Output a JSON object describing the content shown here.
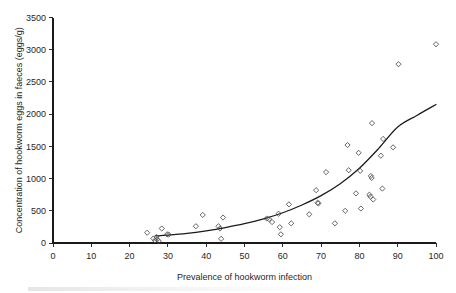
{
  "figure": {
    "background_color": "#ffffff",
    "axis_color": "#1a1a1a",
    "marker_color": "#4a4a4a",
    "curve_color": "#1a1a1a"
  },
  "chart_data": {
    "type": "scatter",
    "title": "",
    "subtitle": "",
    "xlabel": "Prevalence of hookworm infection",
    "ylabel": "Concentration of hookworm eggs in faeces (eggs/g)",
    "xlim": [
      0,
      100
    ],
    "ylim": [
      0,
      3500
    ],
    "xticks": [
      0,
      10,
      20,
      30,
      40,
      50,
      60,
      70,
      80,
      90,
      100
    ],
    "yticks": [
      0,
      500,
      1000,
      1500,
      2000,
      2500,
      3000,
      3500
    ],
    "xtick_labels": [
      "0",
      "10",
      "20",
      "30",
      "40",
      "50",
      "60",
      "70",
      "80",
      "90",
      "100"
    ],
    "ytick_labels": [
      "0",
      "500",
      "1000",
      "1500",
      "2000",
      "2500",
      "3000",
      "3500"
    ],
    "grid": false,
    "legend": null,
    "legend_position": "none",
    "marker_shape": "open-diamond",
    "series": [
      {
        "name": "Observed communities",
        "type": "scatter",
        "points": [
          [
            24.6,
            160
          ],
          [
            26.2,
            70
          ],
          [
            26.6,
            40
          ],
          [
            27.0,
            95
          ],
          [
            27.2,
            55
          ],
          [
            27.6,
            30
          ],
          [
            28.4,
            225
          ],
          [
            29.8,
            135
          ],
          [
            30.2,
            130
          ],
          [
            37.3,
            260
          ],
          [
            39.1,
            435
          ],
          [
            43.2,
            260
          ],
          [
            43.6,
            225
          ],
          [
            43.9,
            65
          ],
          [
            44.4,
            395
          ],
          [
            55.8,
            380
          ],
          [
            56.4,
            370
          ],
          [
            57.2,
            325
          ],
          [
            58.9,
            455
          ],
          [
            59.2,
            245
          ],
          [
            59.5,
            135
          ],
          [
            61.6,
            600
          ],
          [
            62.2,
            305
          ],
          [
            66.9,
            445
          ],
          [
            68.7,
            820
          ],
          [
            69.1,
            625
          ],
          [
            69.3,
            615
          ],
          [
            71.3,
            1100
          ],
          [
            73.6,
            305
          ],
          [
            76.3,
            500
          ],
          [
            76.9,
            1520
          ],
          [
            77.2,
            1130
          ],
          [
            79.1,
            770
          ],
          [
            79.8,
            1400
          ],
          [
            80.2,
            1120
          ],
          [
            80.4,
            535
          ],
          [
            82.6,
            750
          ],
          [
            82.9,
            720
          ],
          [
            83.0,
            1040
          ],
          [
            83.2,
            1010
          ],
          [
            83.3,
            1860
          ],
          [
            83.6,
            675
          ],
          [
            85.6,
            1355
          ],
          [
            86.0,
            845
          ],
          [
            86.2,
            1615
          ],
          [
            88.8,
            1485
          ],
          [
            90.2,
            2775
          ],
          [
            100.0,
            3085
          ]
        ]
      },
      {
        "name": "Fitted exponential curve",
        "type": "line",
        "points": [
          [
            26.8,
            110
          ],
          [
            30.0,
            122
          ],
          [
            35.0,
            150
          ],
          [
            40.0,
            190
          ],
          [
            45.0,
            240
          ],
          [
            50.0,
            300
          ],
          [
            55.0,
            375
          ],
          [
            60.0,
            470
          ],
          [
            65.0,
            590
          ],
          [
            70.0,
            735
          ],
          [
            75.0,
            920
          ],
          [
            80.0,
            1160
          ],
          [
            85.0,
            1465
          ],
          [
            90.0,
            1800
          ],
          [
            95.0,
            1980
          ],
          [
            100.0,
            2150
          ]
        ]
      }
    ]
  }
}
